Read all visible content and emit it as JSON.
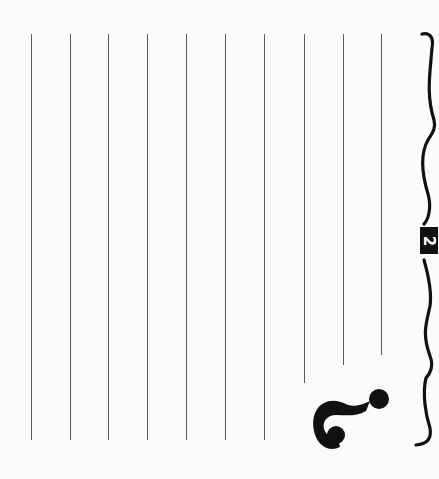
{
  "worksheet": {
    "orientation": "rotated-90-clockwise",
    "badge_number": "2",
    "icon": "question-mark-icon",
    "line_color": "#5a5a5a",
    "ink_color": "#111111",
    "paper_color": "#fbfbfa",
    "writing_lines": [
      {
        "x": 31,
        "top": 34,
        "bottom": 440
      },
      {
        "x": 70,
        "top": 34,
        "bottom": 440
      },
      {
        "x": 108,
        "top": 34,
        "bottom": 440
      },
      {
        "x": 147,
        "top": 34,
        "bottom": 440
      },
      {
        "x": 186,
        "top": 34,
        "bottom": 440
      },
      {
        "x": 225,
        "top": 34,
        "bottom": 440
      },
      {
        "x": 264,
        "top": 34,
        "bottom": 440
      },
      {
        "x": 304,
        "top": 34,
        "bottom": 383
      },
      {
        "x": 343,
        "top": 34,
        "bottom": 365
      },
      {
        "x": 381,
        "top": 34,
        "bottom": 355
      }
    ]
  }
}
